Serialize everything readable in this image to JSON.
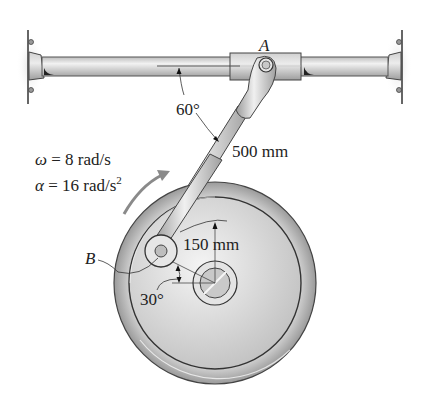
{
  "diagram": {
    "points": {
      "A": {
        "label": "A",
        "description": "pin on slider collar"
      },
      "B": {
        "label": "B",
        "description": "crank pin on wheel"
      }
    },
    "dimensions": {
      "rod_length": "500 mm",
      "crank_radius": "150 mm",
      "rod_angle": "60°",
      "crank_angle": "30°"
    },
    "kinematics": {
      "omega_symbol": "ω",
      "omega_text": " = 8 rad/s",
      "alpha_symbol": "α",
      "alpha_text": " = 16 rad/s",
      "alpha_exp": "2"
    },
    "colors": {
      "metal_light": "#e8e8e8",
      "metal_mid": "#c4c4c4",
      "metal_dark": "#8c8c8c",
      "outline": "#3a3a3a",
      "arrow": "#8a8a8a"
    }
  }
}
